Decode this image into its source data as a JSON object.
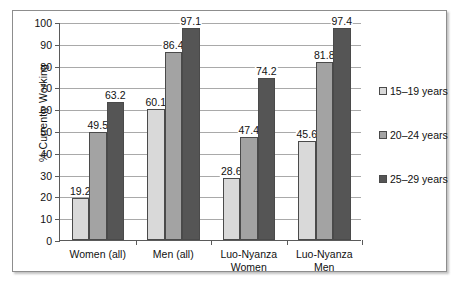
{
  "chart_data": {
    "type": "bar",
    "title": "",
    "subtitle": "",
    "xlabel": "",
    "ylabel": "% Currently Working",
    "ylim": [
      0,
      100
    ],
    "ytick_step": 10,
    "yticks": [
      "0",
      "10",
      "20",
      "30",
      "40",
      "50",
      "60",
      "70",
      "80",
      "90",
      "100"
    ],
    "grid": true,
    "grid_orientation": "horizontal",
    "legend_position": "right",
    "categories": [
      "Women (all)",
      "Men (all)",
      "Luo-Nyanza Women",
      "Luo-Nyanza Men"
    ],
    "category_lines": [
      [
        "Women (all)"
      ],
      [
        "Men (all)"
      ],
      [
        "Luo-Nyanza",
        "Women"
      ],
      [
        "Luo-Nyanza",
        "Men"
      ]
    ],
    "series": [
      {
        "name": "15–19 years",
        "color": "#d9d9d9",
        "values": [
          19.2,
          60.1,
          28.6,
          45.6
        ],
        "labels": [
          "19.2",
          "60.1",
          "28.6",
          "45.6"
        ]
      },
      {
        "name": "20–24 years",
        "color": "#a3a3a3",
        "values": [
          49.5,
          86.4,
          47.4,
          81.8
        ],
        "labels": [
          "49.5",
          "86.4",
          "47.4",
          "81.8"
        ]
      },
      {
        "name": "25–29 years",
        "color": "#555555",
        "values": [
          63.2,
          97.1,
          74.2,
          97.4
        ],
        "labels": [
          "63.2",
          "97.1",
          "74.2",
          "97.4"
        ]
      }
    ]
  },
  "legend": {
    "items": [
      {
        "label": "15–19 years",
        "color": "#d9d9d9"
      },
      {
        "label": "20–24 years",
        "color": "#a3a3a3"
      },
      {
        "label": "25–29 years",
        "color": "#555555"
      }
    ]
  },
  "colors": {
    "series_15_19": "#d9d9d9",
    "series_20_24": "#a3a3a3",
    "series_25_29": "#555555",
    "axis": "#5a5a5a",
    "gridline": "#a9a9a9",
    "frame": "#8d8d8d",
    "background": "#ffffff",
    "text": "#111111"
  }
}
